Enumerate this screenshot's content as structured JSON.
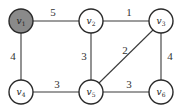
{
  "graph": {
    "type": "weighted-undirected-graph",
    "nodes": [
      {
        "id": "v1",
        "letter": "v",
        "sub": "1",
        "x": 21,
        "y": 21,
        "highlighted": true,
        "fill": "#8a8a8a"
      },
      {
        "id": "v2",
        "letter": "v",
        "sub": "2",
        "x": 91,
        "y": 21,
        "highlighted": false,
        "fill": "#ffffff"
      },
      {
        "id": "v3",
        "letter": "v",
        "sub": "3",
        "x": 161,
        "y": 21,
        "highlighted": false,
        "fill": "#ffffff"
      },
      {
        "id": "v4",
        "letter": "v",
        "sub": "4",
        "x": 21,
        "y": 92,
        "highlighted": false,
        "fill": "#ffffff"
      },
      {
        "id": "v5",
        "letter": "v",
        "sub": "5",
        "x": 91,
        "y": 92,
        "highlighted": false,
        "fill": "#ffffff"
      },
      {
        "id": "v6",
        "letter": "v",
        "sub": "6",
        "x": 161,
        "y": 92,
        "highlighted": false,
        "fill": "#ffffff"
      }
    ],
    "edges": [
      {
        "from": "v1",
        "to": "v2",
        "weight": "5"
      },
      {
        "from": "v2",
        "to": "v3",
        "weight": "1"
      },
      {
        "from": "v1",
        "to": "v4",
        "weight": "4"
      },
      {
        "from": "v2",
        "to": "v5",
        "weight": "3"
      },
      {
        "from": "v3",
        "to": "v5",
        "weight": "2"
      },
      {
        "from": "v3",
        "to": "v6",
        "weight": "4"
      },
      {
        "from": "v4",
        "to": "v5",
        "weight": "3"
      },
      {
        "from": "v5",
        "to": "v6",
        "weight": "3"
      }
    ]
  }
}
